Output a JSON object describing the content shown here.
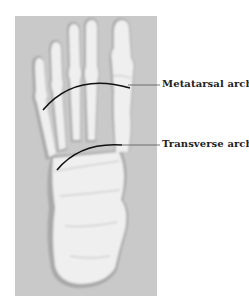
{
  "figure": {
    "labels": [
      {
        "id": "metatarsal",
        "text": "Metatarsal arch"
      },
      {
        "id": "transverse",
        "text": "Transverse arch"
      }
    ],
    "colors": {
      "background": "#c9c9c9",
      "bone": "#f2f2f2",
      "bone_shadow": "#9a9a9a",
      "arch_line": "#111111",
      "leader_line": "#555555"
    }
  }
}
